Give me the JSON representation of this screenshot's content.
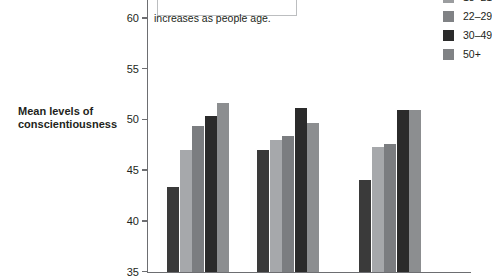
{
  "chart_data": {
    "type": "bar",
    "title": "",
    "subtitle": "",
    "xlabel": "",
    "ylabel": "Mean levels of conscientiousness",
    "ylim": [
      35,
      60
    ],
    "ytick_labels": [
      "35",
      "40",
      "45",
      "50",
      "55",
      "60"
    ],
    "ytick_values": [
      35,
      40,
      45,
      50,
      55,
      60
    ],
    "grid": false,
    "legend_position": "top-right",
    "categories": [
      "Group 1",
      "Group 2",
      "Group 3"
    ],
    "series": [
      {
        "name": "18–21",
        "values": [
          43.3,
          47.0,
          44.0
        ],
        "color": "#3a3a3a"
      },
      {
        "name": "22–29",
        "values": [
          47.0,
          48.0,
          47.3
        ],
        "color": "#a6a8ab"
      },
      {
        "name": "30–49",
        "values": [
          49.4,
          48.4,
          47.6
        ],
        "color": "#7b7d80"
      },
      {
        "name": "50+",
        "values": [
          50.3,
          51.1,
          50.9
        ],
        "color": "#2b2b2b"
      },
      {
        "name": "50+",
        "values": [
          51.6,
          49.7,
          50.9
        ],
        "color": "#8c8e90"
      }
    ],
    "annotation": {
      "text": "increases as people age.",
      "box": true
    }
  },
  "axis": {
    "y_title_line1": "Mean levels of",
    "y_title_line2": "conscientiousness"
  },
  "legend": {
    "entries": [
      {
        "label": "18–21",
        "color": "#9b9d9f"
      },
      {
        "label": "22–29",
        "color": "#808285"
      },
      {
        "label": "30–49",
        "color": "#2b2b2b"
      },
      {
        "label": "50+",
        "color": "#808285"
      }
    ]
  }
}
